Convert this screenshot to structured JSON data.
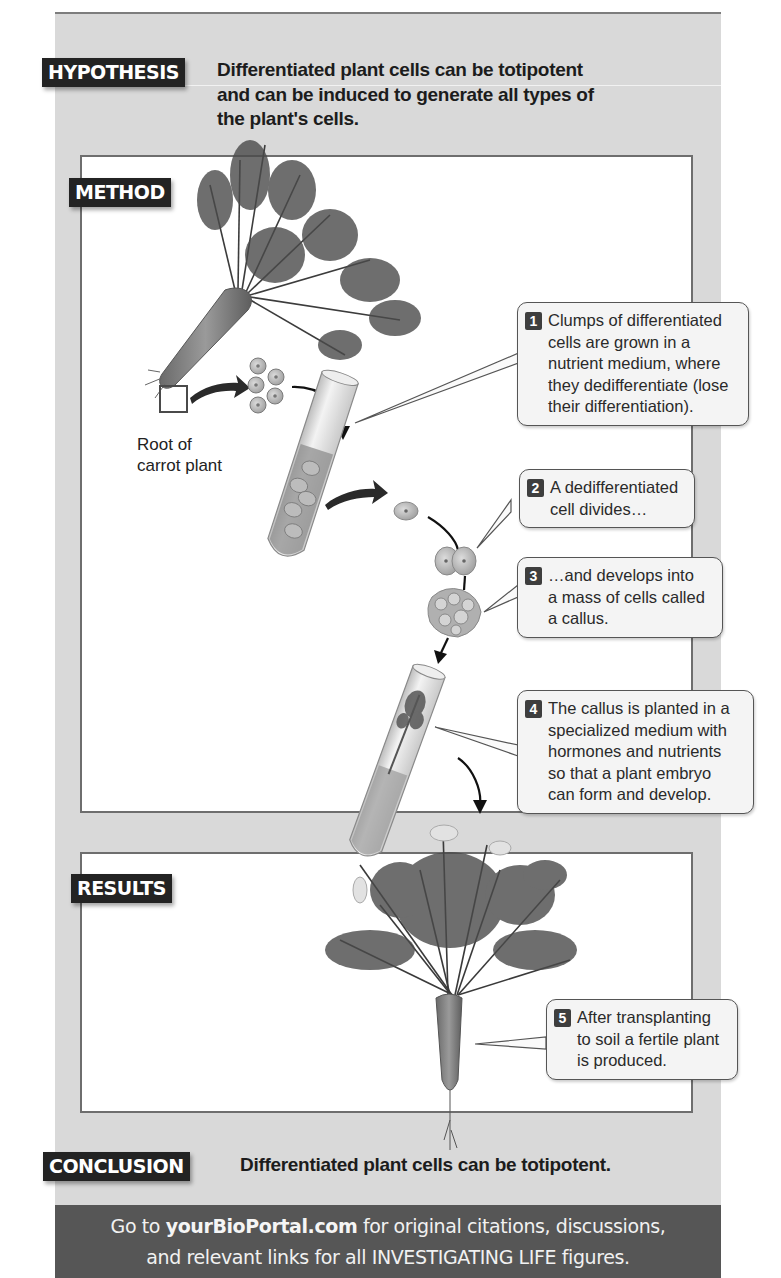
{
  "hypothesis": {
    "tag": "HYPOTHESIS",
    "lines": [
      "Differentiated plant cells can be totipotent",
      "and can be induced to generate all types of",
      "the plant's cells."
    ]
  },
  "method": {
    "tag": "METHOD",
    "root_label_lines": [
      "Root of",
      "carrot plant"
    ],
    "steps": [
      {
        "number": "1",
        "lines": [
          "Clumps of differentiated",
          "cells are grown in a",
          "nutrient medium, where",
          "they dedifferentiate (lose",
          "their differentiation)."
        ]
      },
      {
        "number": "2",
        "lines": [
          "A dedifferentiated",
          "cell divides…"
        ]
      },
      {
        "number": "3",
        "lines": [
          "…and develops into",
          "a mass of cells called",
          "a callus."
        ]
      },
      {
        "number": "4",
        "lines": [
          "The callus is planted in a",
          "specialized medium with",
          "hormones and nutrients",
          "so that a plant embryo",
          "can form and develop."
        ]
      }
    ]
  },
  "results": {
    "tag": "RESULTS",
    "steps": [
      {
        "number": "5",
        "lines": [
          "After transplanting",
          "to soil a fertile plant",
          "is produced."
        ]
      }
    ]
  },
  "conclusion": {
    "tag": "CONCLUSION",
    "text": "Differentiated plant cells can be totipotent."
  },
  "footer": {
    "prefix": "Go to ",
    "link": "yourBioPortal.com",
    "suffix": " for original citations, discussions,",
    "line2": "and relevant links for all INVESTIGATING LIFE figures."
  },
  "colors": {
    "panel_bg": "#d9d9d9",
    "tag_bg": "#232323",
    "footer_bg": "#565656",
    "callout_bg": "#f4f4f4"
  }
}
